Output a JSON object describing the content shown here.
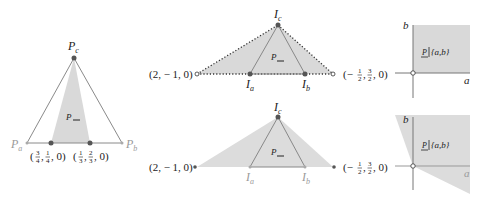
{
  "colors": {
    "region_fill": "#d9d9d9",
    "line": "#7a7a7a",
    "dark": "#222222",
    "light_label": "#9a9a9a"
  },
  "panel_left": {
    "vertex_top": "P",
    "vertex_top_sub": "c",
    "vertex_left": "P",
    "vertex_left_sub": "a",
    "vertex_right": "P",
    "vertex_right_sub": "b",
    "region_label": "P",
    "point1_label": "(3/4, 1/4, 0)",
    "point1": {
      "open": "(",
      "n1": "3",
      "d1": "4",
      "n2": "1",
      "d2": "4",
      "tail": ", 0)"
    },
    "point2": {
      "open": "(",
      "n1": "1",
      "d1": "3",
      "n2": "2",
      "d2": "3",
      "tail": ", 0)"
    }
  },
  "panel_mid_top": {
    "left_point": "(2, − 1, 0)",
    "apex": "I",
    "apex_sub": "c",
    "base_left": "I",
    "base_left_sub": "a",
    "base_right": "I",
    "base_right_sub": "b",
    "region_label": "P"
  },
  "panel_mid_bottom": {
    "left_point": "(2, − 1, 0)",
    "apex": "I",
    "apex_sub": "c",
    "base_left": "I",
    "base_left_sub": "a",
    "base_right": "I",
    "base_right_sub": "b",
    "region_label": "P"
  },
  "panel_right_top": {
    "origin_point": {
      "open": "(− ",
      "n1": "1",
      "d1": "2",
      "n2": "3",
      "d2": "2",
      "tail": ", 0)"
    },
    "axis_x": "a",
    "axis_y": "b",
    "region_label": "P|{a,b}",
    "region_p": "P",
    "region_set": "{a,b}"
  },
  "panel_right_bottom": {
    "origin_point": {
      "open": "(− ",
      "n1": "1",
      "d1": "2",
      "n2": "3",
      "d2": "2",
      "tail": ", 0)"
    },
    "axis_x": "a",
    "axis_y": "b",
    "region_label": "P|{a,b}",
    "region_p": "P",
    "region_set": "{a,b}"
  }
}
